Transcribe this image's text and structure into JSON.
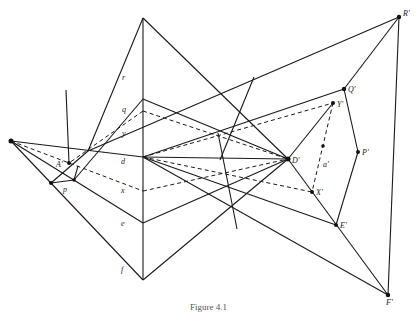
{
  "figure": {
    "caption": "Figure 4.1",
    "labels": {
      "r": "r",
      "q": "q",
      "y": "y",
      "d": "d",
      "x": "x",
      "e": "e",
      "f": "f",
      "A_prime": "A'",
      "p": "p",
      "R_prime": "R'",
      "Q_prime": "Q'",
      "Y_prime": "Y'",
      "a_prime": "a'",
      "P_prime": "P'",
      "D_prime": "D'",
      "X_prime": "X'",
      "E_prime": "E'",
      "F_prime": "F'"
    },
    "colors": {
      "line": "#1a1a1a",
      "background": "#ffffff"
    }
  }
}
